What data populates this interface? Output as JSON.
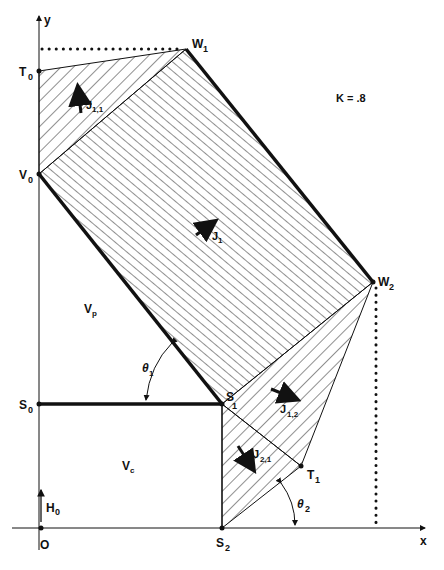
{
  "diagram": {
    "title_param": "K = .8",
    "axes": {
      "x_label": "x",
      "y_label": "y",
      "origin_label": "O"
    },
    "points": {
      "T0": {
        "label": "T",
        "sub": "0"
      },
      "V0": {
        "label": "V",
        "sub": "0"
      },
      "S0": {
        "label": "S",
        "sub": "0"
      },
      "W1": {
        "label": "W",
        "sub": "1"
      },
      "W2": {
        "label": "W",
        "sub": "2"
      },
      "S1": {
        "label": "S",
        "sub": "1"
      },
      "T1": {
        "label": "T",
        "sub": "1"
      },
      "S2": {
        "label": "S",
        "sub": "2"
      }
    },
    "regions": {
      "J1": {
        "label": "J",
        "sub": "1"
      },
      "J11": {
        "label": "J",
        "sub": "1,1"
      },
      "J12": {
        "label": "J",
        "sub": "1,2"
      },
      "J21": {
        "label": "J",
        "sub": "2,1"
      },
      "Vp": {
        "label": "V",
        "sub": "p"
      },
      "Vc": {
        "label": "V",
        "sub": "c"
      },
      "H0": {
        "label": "H",
        "sub": "0"
      }
    },
    "angles": {
      "theta1": {
        "label": "θ",
        "sub": "1"
      },
      "theta2": {
        "label": "θ",
        "sub": "2"
      }
    },
    "colors": {
      "ink": "#111111",
      "background": "#ffffff"
    }
  }
}
